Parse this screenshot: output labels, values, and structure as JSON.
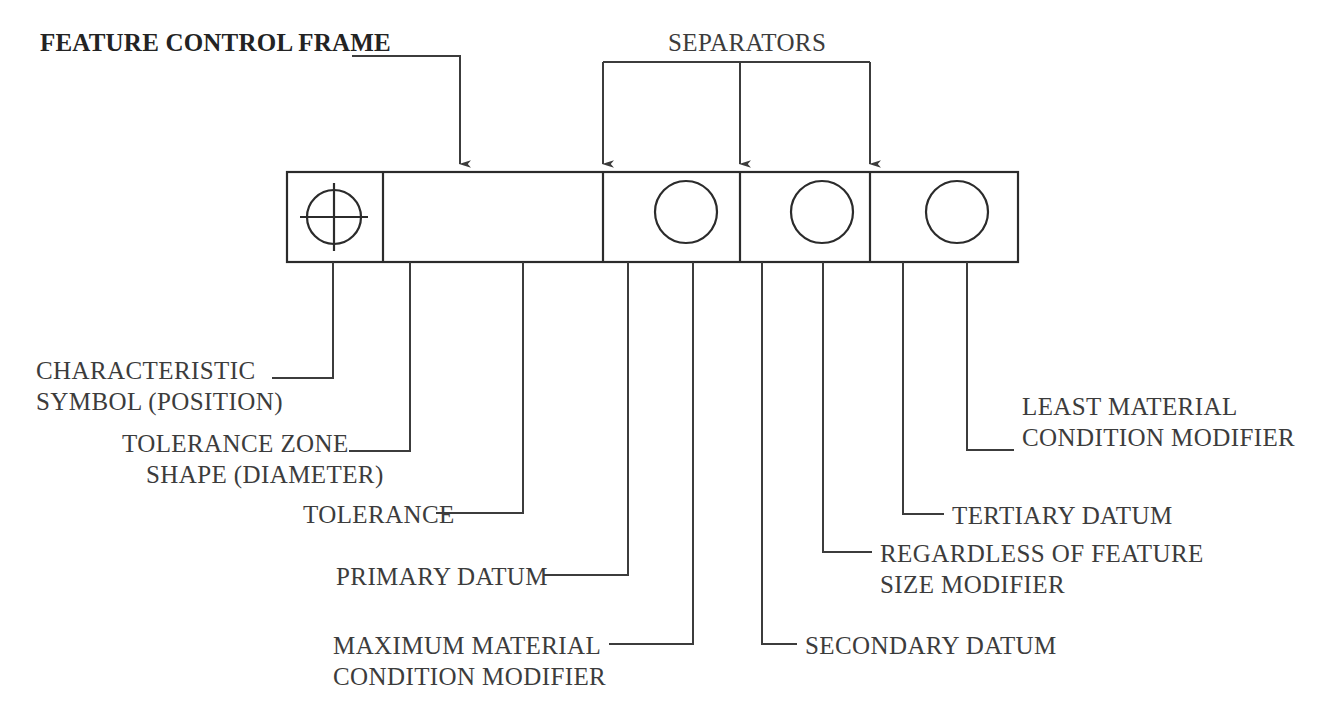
{
  "diagram": {
    "line_color": "#3c3c3c",
    "frame_color": "#2b2b2b",
    "text_color": "#3c3c3c"
  },
  "callouts": {
    "feature_control_frame": "FEATURE CONTROL FRAME",
    "separators": "SEPARATORS",
    "characteristic_symbol_l1": "CHARACTERISTIC",
    "characteristic_symbol_l2": "SYMBOL (POSITION)",
    "tolerance_zone_l1": "TOLERANCE ZONE",
    "tolerance_zone_l2": "SHAPE (DIAMETER)",
    "tolerance": "TOLERANCE",
    "primary_datum": "PRIMARY DATUM",
    "mmc_l1": "MAXIMUM MATERIAL",
    "mmc_l2": "CONDITION MODIFIER",
    "secondary_datum": "SECONDARY DATUM",
    "rfs_l1": "REGARDLESS OF FEATURE",
    "rfs_l2": "SIZE MODIFIER",
    "tertiary_datum": "TERTIARY DATUM",
    "lmc_l1": "LEAST MATERIAL",
    "lmc_l2": "CONDITION MODIFIER"
  },
  "frame": {
    "cells": [
      {
        "id": "characteristic-symbol",
        "kind": "position-symbol",
        "text": ""
      },
      {
        "id": "tolerance-compartment",
        "kind": "diameter-tolerance",
        "diameter_symbol": "Ø",
        "tolerance_value": "XXX"
      },
      {
        "id": "primary-datum-compartment",
        "kind": "datum-with-modifier",
        "datum": "A",
        "modifier": "M"
      },
      {
        "id": "secondary-datum-compartment",
        "kind": "datum-with-modifier",
        "datum": "B",
        "modifier": "S"
      },
      {
        "id": "tertiary-datum-compartment",
        "kind": "datum-with-modifier",
        "datum": "C",
        "modifier": "L"
      }
    ]
  }
}
